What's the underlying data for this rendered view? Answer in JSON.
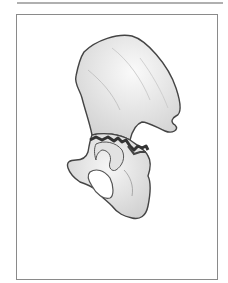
{
  "figure": {
    "colors": {
      "bone": "#ececec",
      "outline": "#444444",
      "fracture": "#3a3a3a",
      "frame": "#8a8a8a",
      "rule": "#b0b0b0"
    }
  }
}
